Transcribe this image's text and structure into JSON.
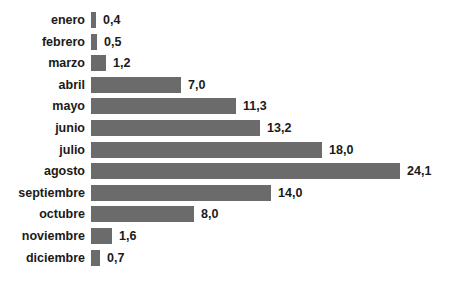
{
  "chart_data": {
    "type": "bar",
    "orientation": "horizontal",
    "title": "",
    "xlabel": "",
    "ylabel": "",
    "categories": [
      "enero",
      "febrero",
      "marzo",
      "abril",
      "mayo",
      "junio",
      "julio",
      "agosto",
      "septiembre",
      "octubre",
      "noviembre",
      "diciembre"
    ],
    "values": [
      0.4,
      0.5,
      1.2,
      7.0,
      11.3,
      13.2,
      18.0,
      24.1,
      14.0,
      8.0,
      1.6,
      0.7
    ],
    "value_labels": [
      "0,4",
      "0,5",
      "1,2",
      "7,0",
      "11,3",
      "13,2",
      "18,0",
      "24,1",
      "14,0",
      "8,0",
      "1,6",
      "0,7"
    ],
    "xlim": [
      0,
      24.1
    ],
    "grid": false,
    "legend": null,
    "bar_color": "#6b6b6b"
  }
}
